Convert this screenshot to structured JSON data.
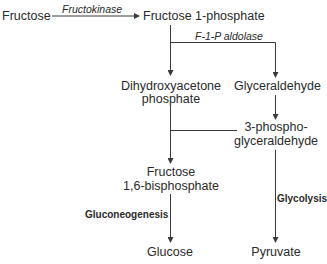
{
  "diagram": {
    "nodes": {
      "fructose": "Fructose",
      "fructose_1_phosphate": "Fructose 1-phosphate",
      "dhap_line1": "Dihydroxyacetone",
      "dhap_line2": "phosphate",
      "glyceraldehyde": "Glyceraldehyde",
      "g3p_line1": "3-phospho-",
      "g3p_line2": "glyceraldehyde",
      "f16bp_line1": "Fructose",
      "f16bp_line2": "1,6-bisphosphate",
      "glucose": "Glucose",
      "pyruvate": "Pyruvate"
    },
    "enzymes": {
      "fructokinase": "Fructokinase",
      "f1p_aldolase": "F-1-P aldolase"
    },
    "processes": {
      "gluconeogenesis": "Gluconeogenesis",
      "glycolysis": "Glycolysis"
    },
    "colors": {
      "line": "#3a3a3a",
      "text": "#2a2a2a"
    }
  }
}
